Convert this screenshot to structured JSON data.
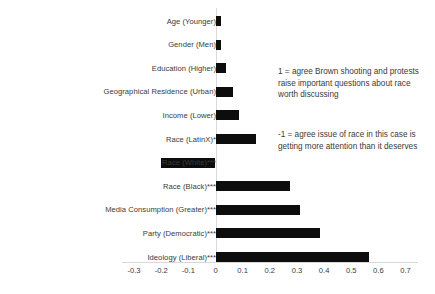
{
  "chart_data": {
    "type": "bar",
    "orientation": "horizontal",
    "title": "",
    "xlabel": "",
    "ylabel": "",
    "xlim": [
      -0.3,
      0.7
    ],
    "xticks": [
      -0.3,
      -0.2,
      -0.1,
      0,
      0.1,
      0.2,
      0.3,
      0.4,
      0.5,
      0.6,
      0.7
    ],
    "xtick_labels": [
      "-0.3",
      "-0.2",
      "-0.1",
      "0",
      "0.1",
      "0.2",
      "0.3",
      "0.4",
      "0.5",
      "0.6",
      "0.7"
    ],
    "grid": false,
    "legend": null,
    "bar_color": "#0d0d0d",
    "zero_line_color": "#d9d9d9",
    "categories": [
      "Age (Younger)",
      "Gender (Men)",
      "Education (Higher)",
      "Geographical Residence (Urban)",
      "Income (Lower)",
      "Race (LatinX)*",
      "Race (White)***",
      "Race (Black)***",
      "Media Consumption (Greater)***",
      "Party (Democratic)***",
      "Ideology (Liberal)***"
    ],
    "values": [
      0.02,
      0.02,
      0.04,
      0.065,
      0.085,
      0.15,
      -0.2,
      0.275,
      0.31,
      0.385,
      0.565
    ],
    "annotations": [
      "1 = agree Brown shooting and protests raise important questions about race worth discussing",
      "-1 = agree issue of race in this case is getting more attention than it deserves"
    ]
  },
  "annotations": {
    "positive": "1 = agree Brown shooting and protests raise important questions about race worth discussing",
    "negative": "-1 = agree issue of race in this case is getting more attention than it deserves"
  }
}
